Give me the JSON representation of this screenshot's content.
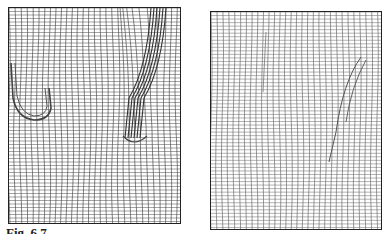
{
  "figure": {
    "caption": "Fig. 6.7",
    "panels": [
      {
        "id": "left",
        "description": "Deformed mesh grid with two dense distorted regions (U-shaped loop at left, curved band at right)",
        "columns": 30,
        "rows": 62,
        "line_color": "#333333",
        "features": [
          "u-loop-left",
          "dense-curved-band-right"
        ]
      },
      {
        "id": "right",
        "description": "Refined mesh grid with a single curved fault-like band at right",
        "columns": 30,
        "rows": 62,
        "line_color": "#555555",
        "features": [
          "curved-band-right"
        ]
      }
    ]
  }
}
